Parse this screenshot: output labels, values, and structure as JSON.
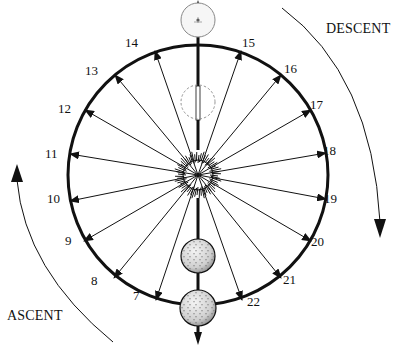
{
  "diagram": {
    "type": "cyclic-arrow-diagram",
    "center": {
      "x": 198,
      "y": 175
    },
    "radius": 132,
    "labels": {
      "ascent": "ASCENT",
      "descent": "DESCENT"
    },
    "points": [
      {
        "n": "7",
        "x": 140,
        "y": 297
      },
      {
        "n": "8",
        "x": 98,
        "y": 282
      },
      {
        "n": "9",
        "x": 72,
        "y": 242
      },
      {
        "n": "10",
        "x": 54,
        "y": 200
      },
      {
        "n": "11",
        "x": 52,
        "y": 155
      },
      {
        "n": "12",
        "x": 65,
        "y": 110
      },
      {
        "n": "13",
        "x": 92,
        "y": 72
      },
      {
        "n": "14",
        "x": 132,
        "y": 44
      },
      {
        "n": "15",
        "x": 249,
        "y": 44
      },
      {
        "n": "16",
        "x": 291,
        "y": 70
      },
      {
        "n": "17",
        "x": 317,
        "y": 106
      },
      {
        "n": "18",
        "x": 330,
        "y": 152
      },
      {
        "n": "19",
        "x": 331,
        "y": 200
      },
      {
        "n": "20",
        "x": 318,
        "y": 243
      },
      {
        "n": "21",
        "x": 290,
        "y": 281
      },
      {
        "n": "22",
        "x": 254,
        "y": 303
      }
    ],
    "arrow_targets": [
      {
        "n": "7",
        "x": 156,
        "y": 300
      },
      {
        "n": "8",
        "x": 114,
        "y": 278
      },
      {
        "n": "9",
        "x": 84,
        "y": 241
      },
      {
        "n": "10",
        "x": 70,
        "y": 201
      },
      {
        "n": "11",
        "x": 70,
        "y": 154
      },
      {
        "n": "12",
        "x": 85,
        "y": 110
      },
      {
        "n": "13",
        "x": 115,
        "y": 75
      },
      {
        "n": "14",
        "x": 155,
        "y": 51
      },
      {
        "n": "15",
        "x": 241,
        "y": 51
      },
      {
        "n": "16",
        "x": 281,
        "y": 75
      },
      {
        "n": "17",
        "x": 311,
        "y": 110
      },
      {
        "n": "18",
        "x": 326,
        "y": 153
      },
      {
        "n": "19",
        "x": 326,
        "y": 199
      },
      {
        "n": "20",
        "x": 311,
        "y": 241
      },
      {
        "n": "21",
        "x": 281,
        "y": 278
      },
      {
        "n": "22",
        "x": 242,
        "y": 300
      }
    ],
    "spheres": [
      {
        "name": "top-sphere",
        "cx": 198,
        "cy": 20,
        "r": 17,
        "style": "light"
      },
      {
        "name": "dashed-sphere",
        "cx": 198,
        "cy": 102,
        "r": 17,
        "style": "dashed"
      },
      {
        "name": "middle-sphere",
        "cx": 198,
        "cy": 256,
        "r": 17,
        "style": "textured"
      },
      {
        "name": "bottom-sphere",
        "cx": 198,
        "cy": 308,
        "r": 18,
        "style": "textured"
      }
    ],
    "colors": {
      "ink": "#111111",
      "background": "#ffffff",
      "dashed": "#888888"
    }
  }
}
